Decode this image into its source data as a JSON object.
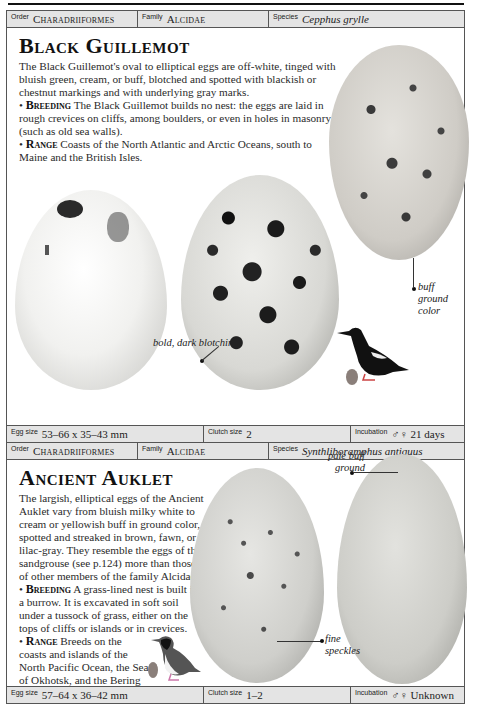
{
  "entries": [
    {
      "header": {
        "order_label": "Order",
        "order_value": "Charadriiformes",
        "family_label": "Family",
        "family_value": "Alcidae",
        "species_label": "Species",
        "species_value": "Cepphus grylle"
      },
      "title": "Black Guillemot",
      "description": "The Black Guillemot's oval to elliptical eggs are off-white, tinged with bluish green, cream, or buff, blotched and spotted with blackish or chestnut markings and with underlying gray marks.",
      "breeding_label": "Breeding",
      "breeding_text": "The Black Guillemot builds no nest: the eggs are laid in rough crevices on cliffs, among boulders, or even in holes in masonry (such as old sea walls).",
      "range_label": "Range",
      "range_text": "Coasts of the North Atlantic and Arctic Oceans, south to Maine and the British Isles.",
      "annotations": {
        "bold_dark_blotching": "bold, dark blotching",
        "buff_ground_color": "buff ground color"
      },
      "footer": {
        "egg_size_label": "Egg size",
        "egg_size_value": "53–66 x 35–43 mm",
        "clutch_label": "Clutch size",
        "clutch_value": "2",
        "incubation_label": "Incubation",
        "incubation_value": "♂♀ 21 days"
      }
    },
    {
      "header": {
        "order_label": "Order",
        "order_value": "Charadriiformes",
        "family_label": "Family",
        "family_value": "Alcidae",
        "species_label": "Species",
        "species_value": "Synthliboramphus antiquus"
      },
      "title": "Ancient Auklet",
      "description": "The largish, elliptical eggs of the Ancient Auklet vary from bluish milky white to cream or yellowish buff in ground color, spotted and streaked in brown, fawn, or lilac-gray. They resemble the eggs of the sandgrouse (see p.124) more than those of other members of the family Alcidae.",
      "breeding_label": "Breeding",
      "breeding_text": "A grass-lined nest is built in a burrow. It is excavated in soft soil under a tussock of grass, either on the tops of cliffs or islands or in crevices.",
      "range_label": "Range",
      "range_text": "Breeds on the coasts and islands of the North Pacific Ocean, the Sea of Okhotsk, and the Bering Sea.",
      "annotations": {
        "pale_buff_ground": "pale buff ground",
        "fine_speckles": "fine speckles"
      },
      "footer": {
        "egg_size_label": "Egg size",
        "egg_size_value": "57–64 x 36–42 mm",
        "clutch_label": "Clutch size",
        "clutch_value": "1–2",
        "incubation_label": "Incubation",
        "incubation_value": "♂♀ Unknown"
      }
    }
  ],
  "colors": {
    "header_bg": "#e4e4e4",
    "border": "#555555",
    "egg_marker": "#8a7f7a"
  }
}
